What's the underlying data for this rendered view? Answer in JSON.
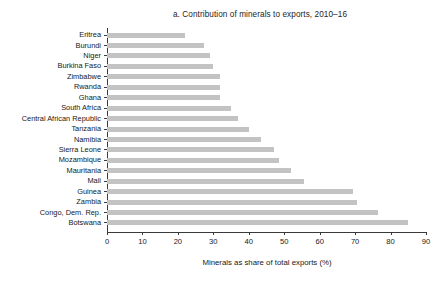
{
  "chart_data": {
    "type": "bar",
    "orientation": "horizontal",
    "title": "a. Contribution of minerals to exports, 2010–16",
    "xlabel": "Minerals as share of total exports (%)",
    "ylabel": "",
    "xlim": [
      0,
      90
    ],
    "xticks": [
      0,
      10,
      20,
      30,
      40,
      50,
      60,
      70,
      80,
      90
    ],
    "xtick_labels": [
      "0",
      "10",
      "20",
      "30",
      "40",
      "50",
      "60",
      "70",
      "80",
      "90"
    ],
    "grid": false,
    "legend": null,
    "bar_color": "#c3c3c3",
    "axis_color": "#3a3a3a",
    "categories": [
      "Eritrea",
      "Burundi",
      "Niger",
      "Burkina Faso",
      "Zimbabwe",
      "Rwanda",
      "Ghana",
      "South Africa",
      "Central African Republic",
      "Tanzania",
      "Namibia",
      "Sierra Leone",
      "Mozambique",
      "Mauritania",
      "Mali",
      "Guinea",
      "Zambia",
      "Congo, Dem. Rep.",
      "Botswana"
    ],
    "values": [
      22.0,
      27.5,
      29.0,
      30.0,
      32.0,
      32.0,
      32.0,
      35.0,
      37.0,
      40.0,
      43.5,
      47.0,
      48.5,
      52.0,
      55.5,
      69.5,
      70.5,
      76.5,
      85.0
    ]
  }
}
